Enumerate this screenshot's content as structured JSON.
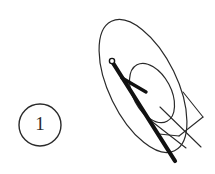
{
  "figure": {
    "background_color": "#ffffff",
    "stroke_color": "#2a2a2a",
    "thick_stroke_color": "#111111",
    "callout": {
      "label": "1",
      "shape": "circle",
      "center_x": 40,
      "center_y": 125,
      "radius": 21,
      "stroke_width": 1.4
    },
    "outer_ellipse": {
      "center_x": 143,
      "center_y": 86,
      "radius_x": 72,
      "radius_y": 34,
      "rotation_deg": 64,
      "stroke_width": 1.2
    },
    "inner_ellipse": {
      "center_x": 152,
      "center_y": 93,
      "radius_x": 32,
      "radius_y": 19,
      "rotation_deg": 62,
      "stroke_width": 1.2
    },
    "needle": {
      "x1": 113,
      "y1": 63,
      "x2": 175,
      "y2": 161,
      "stroke_width": 4.2,
      "tip_circle": {
        "center_x": 112,
        "center_y": 61,
        "radius": 2.6,
        "stroke_width": 1.3
      },
      "barb": {
        "x1": 122,
        "y1": 78,
        "x2": 145,
        "y2": 91,
        "stroke_width": 3.6
      }
    },
    "thin_lines": [
      {
        "name": "kite-upper-right",
        "x1": 183,
        "y1": 92,
        "x2": 203,
        "y2": 117
      },
      {
        "name": "kite-lower-right",
        "x1": 203,
        "y1": 117,
        "x2": 179,
        "y2": 136
      },
      {
        "name": "kite-lower-left",
        "x1": 179,
        "y1": 136,
        "x2": 159,
        "y2": 134
      },
      {
        "name": "cross-diagonal",
        "x1": 160,
        "y1": 107,
        "x2": 200,
        "y2": 146
      },
      {
        "name": "tail-stroke",
        "x1": 150,
        "y1": 120,
        "x2": 186,
        "y2": 148
      }
    ]
  }
}
